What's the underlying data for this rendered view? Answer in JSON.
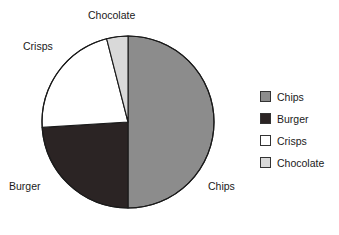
{
  "chart_data": {
    "type": "pie",
    "title": "",
    "categories": [
      "Chips",
      "Burger",
      "Crisps",
      "Chocolate"
    ],
    "values": [
      50,
      24,
      22,
      4
    ],
    "unit": "percent",
    "start_angle_deg": 0,
    "direction": "clockwise",
    "slice_colors": [
      "#8c8c8c",
      "#2b2424",
      "#ffffff",
      "#d9d9d9"
    ],
    "slice_angles_deg": [
      181,
      86,
      80,
      13
    ],
    "outline_color": "#1a1a1a",
    "legend_position": "right",
    "legend_entries": [
      {
        "label": "Chips",
        "color": "#8c8c8c"
      },
      {
        "label": "Burger",
        "color": "#2b2424"
      },
      {
        "label": "Crisps",
        "color": "#ffffff"
      },
      {
        "label": "Chocolate",
        "color": "#d9d9d9"
      }
    ],
    "slice_labels": [
      {
        "label": "Chips",
        "position": "right"
      },
      {
        "label": "Burger",
        "position": "bottom-left"
      },
      {
        "label": "Crisps",
        "position": "top-left"
      },
      {
        "label": "Chocolate",
        "position": "top"
      }
    ]
  },
  "pie": {
    "center_x": 128,
    "center_y": 122,
    "radius": 86,
    "labels": {
      "chocolate": "Chocolate",
      "crisps": "Crisps",
      "burger": "Burger",
      "chips": "Chips"
    }
  },
  "legend": {
    "items": [
      {
        "label": "Chips"
      },
      {
        "label": "Burger"
      },
      {
        "label": "Crisps"
      },
      {
        "label": "Chocolate"
      }
    ]
  },
  "colors": {
    "chips": "#8c8c8c",
    "burger": "#2b2424",
    "crisps": "#ffffff",
    "chocolate": "#d9d9d9",
    "stroke": "#1a1a1a",
    "text": "#1a1a1a",
    "background": "#ffffff"
  }
}
